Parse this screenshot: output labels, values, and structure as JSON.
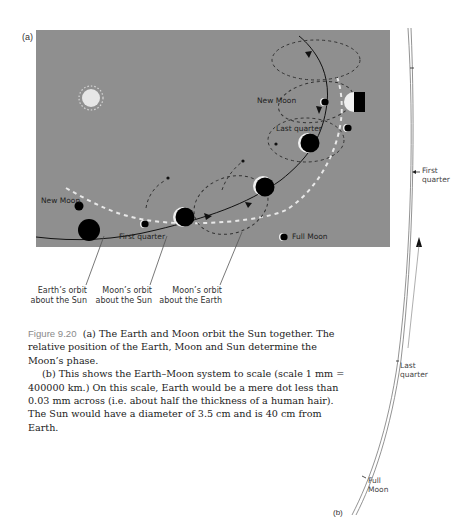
{
  "figure": {
    "panel_a_label": "(a)",
    "panel_b_label": "(b)",
    "panel_a": {
      "background": "#8f8f8f",
      "labels": {
        "new_moon_top": "New Moon",
        "last_quarter": "Last quarter",
        "new_moon_left": "New Moon",
        "first_quarter": "First quarter",
        "full_moon": "Full Moon"
      },
      "callouts": {
        "earth_orbit_line1": "Earth’s orbit",
        "earth_orbit_line2": "about the Sun",
        "moon_orbit_sun_line1": "Moon’s orbit",
        "moon_orbit_sun_line2": "about the Sun",
        "moon_orbit_earth_line1": "Moon’s orbit",
        "moon_orbit_earth_line2": "about the Earth"
      }
    },
    "panel_b": {
      "labels": {
        "first_quarter_line1": "First",
        "first_quarter_line2": "quarter",
        "last_quarter_line1": "Last",
        "last_quarter_line2": "quarter",
        "full_moon_line1": "Full",
        "full_moon_line2": "Moon"
      }
    },
    "caption": {
      "figure_number": "Figure 9.20",
      "para_a": "(a) The Earth and Moon orbit the Sun together. The relative position of the Earth, Moon and Sun determine the Moon’s phase.",
      "para_b": "(b) This shows the Earth–Moon system to scale (scale 1 mm = 400000 km.) On this scale, Earth would be a mere dot less than 0.03 mm across (i.e. about half the thickness of a human hair). The Sun would have a diameter of 3.5 cm and is 40 cm from Earth."
    }
  }
}
